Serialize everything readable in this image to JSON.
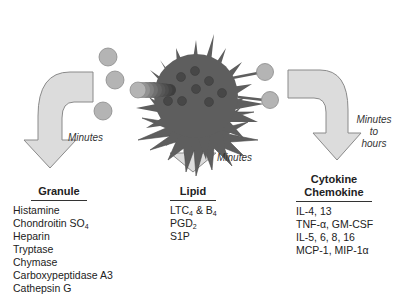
{
  "diagram": {
    "colors": {
      "cell_body": "#5e5e5e",
      "granule_dot": "#474747",
      "released_granule": "#b4b4b4",
      "arrow_fill": "#dcdcdc",
      "arrow_stroke": "#8a8a8a"
    },
    "pathways": [
      {
        "id": "granule",
        "timing": "Minutes",
        "heading": "Granule",
        "items": [
          {
            "text": "Histamine"
          },
          {
            "text": "Chondroitin SO",
            "sub": "4"
          },
          {
            "text": "Heparin"
          },
          {
            "text": "Tryptase"
          },
          {
            "text": "Chymase"
          },
          {
            "text": "Carboxypeptidase A3"
          },
          {
            "text": "Cathepsin G"
          }
        ]
      },
      {
        "id": "lipid",
        "timing": "Minutes",
        "heading": "Lipid",
        "items": [
          {
            "text": "LTC",
            "sub": "4",
            "after": " & B",
            "sub2": "4"
          },
          {
            "text": "PGD",
            "sub": "2"
          },
          {
            "text": "S1P"
          }
        ]
      },
      {
        "id": "cytokine",
        "timing_lines": [
          "Minutes",
          "to",
          "hours"
        ],
        "heading_lines": [
          "Cytokine",
          "Chemokine"
        ],
        "items": [
          {
            "text": "IL-4, 13"
          },
          {
            "text": "TNF-α, GM-CSF"
          },
          {
            "text": "IL-5, 6, 8, 16"
          },
          {
            "text": "MCP-1, MIP-1α"
          }
        ]
      }
    ]
  }
}
